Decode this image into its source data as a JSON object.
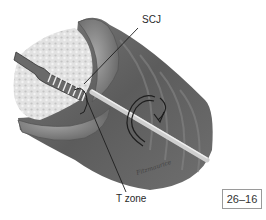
{
  "figure": {
    "type": "medical illustration",
    "labels": {
      "scj": "SCJ",
      "t_zone": "T zone"
    },
    "figure_number": "26–16",
    "signature": "Fitzmaurice",
    "colors": {
      "tissue_dark": "#5f5f5f",
      "tissue_mid": "#8a8a8a",
      "mucosa_light": "#d8d8d8",
      "brush_shaft": "#cfcfcf",
      "outline": "#1e1e1e"
    }
  }
}
